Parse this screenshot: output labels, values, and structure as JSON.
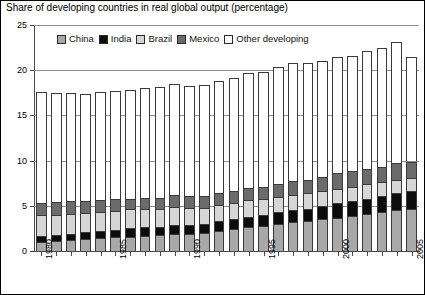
{
  "chart_data": {
    "type": "bar",
    "subtype": "stacked-vertical",
    "title": "Share of developing countries in real global output (percentage)",
    "xlabel": "",
    "ylabel": "",
    "ylim": [
      0,
      25
    ],
    "yticks": [
      0,
      5,
      10,
      15,
      20,
      25
    ],
    "grid": true,
    "grid_axis": "y",
    "legend_position": "top-inside",
    "categories": [
      1980,
      1981,
      1982,
      1983,
      1984,
      1985,
      1986,
      1987,
      1988,
      1989,
      1990,
      1991,
      1992,
      1993,
      1994,
      1995,
      1996,
      1997,
      1998,
      1999,
      2000,
      2001,
      2002,
      2003,
      2004,
      2005
    ],
    "xtick_labels": [
      "1980",
      "1985",
      "1990",
      "1995",
      "2000",
      "2005"
    ],
    "xtick_label_years": [
      1980,
      1985,
      1990,
      1995,
      2000,
      2005
    ],
    "series": [
      {
        "name": "China",
        "color": "#a8a8a8",
        "values": [
          1.0,
          1.1,
          1.2,
          1.3,
          1.4,
          1.5,
          1.6,
          1.7,
          1.8,
          1.9,
          1.9,
          2.0,
          2.2,
          2.4,
          2.6,
          2.8,
          3.0,
          3.2,
          3.3,
          3.5,
          3.7,
          3.9,
          4.1,
          4.3,
          4.5,
          4.6
        ]
      },
      {
        "name": "India",
        "color": "#0c0c0c",
        "values": [
          0.7,
          0.7,
          0.7,
          0.8,
          0.8,
          0.8,
          0.9,
          0.9,
          0.9,
          1.0,
          1.0,
          1.0,
          1.1,
          1.1,
          1.2,
          1.2,
          1.3,
          1.3,
          1.4,
          1.5,
          1.6,
          1.6,
          1.7,
          1.8,
          1.9,
          2.0
        ]
      },
      {
        "name": "Brazil",
        "color": "#d6d6d6",
        "values": [
          2.3,
          2.2,
          2.2,
          2.1,
          2.1,
          2.1,
          2.1,
          2.1,
          2.0,
          2.0,
          1.9,
          1.8,
          1.8,
          1.8,
          1.8,
          1.8,
          1.7,
          1.7,
          1.7,
          1.6,
          1.6,
          1.6,
          1.6,
          1.5,
          1.5,
          1.5
        ]
      },
      {
        "name": "Mexico",
        "color": "#6b6b6b",
        "values": [
          1.3,
          1.4,
          1.4,
          1.3,
          1.3,
          1.3,
          1.2,
          1.2,
          1.2,
          1.3,
          1.3,
          1.3,
          1.3,
          1.3,
          1.4,
          1.3,
          1.4,
          1.5,
          1.5,
          1.6,
          1.7,
          1.7,
          1.7,
          1.7,
          1.8,
          1.8
        ]
      },
      {
        "name": "Other developing",
        "color": "#ffffff",
        "values": [
          12.3,
          12.1,
          12.0,
          11.9,
          12.0,
          12.0,
          12.0,
          12.1,
          12.2,
          12.3,
          12.2,
          12.3,
          12.4,
          12.5,
          12.7,
          12.7,
          13.0,
          13.1,
          12.9,
          12.8,
          12.9,
          12.8,
          13.0,
          13.2,
          13.4,
          11.6
        ]
      }
    ],
    "totals": [
      17.6,
      17.5,
      17.5,
      17.4,
      17.6,
      17.7,
      17.8,
      18.0,
      18.1,
      18.5,
      18.3,
      18.4,
      18.8,
      19.1,
      19.7,
      19.8,
      20.4,
      20.8,
      20.8,
      21.0,
      21.5,
      21.6,
      22.1,
      22.5,
      23.1,
      21.5
    ]
  },
  "legend": {
    "items": [
      {
        "label": "China",
        "color": "#a8a8a8"
      },
      {
        "label": "India",
        "color": "#0c0c0c"
      },
      {
        "label": "Brazil",
        "color": "#d6d6d6"
      },
      {
        "label": "Mexico",
        "color": "#6b6b6b"
      },
      {
        "label": "Other developing",
        "color": "#ffffff"
      }
    ]
  }
}
